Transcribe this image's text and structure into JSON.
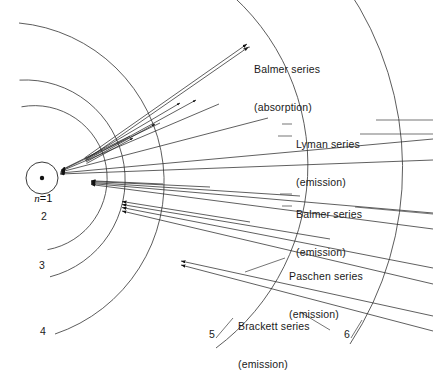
{
  "figure": {
    "type": "bohr-model-spectral-series-diagram",
    "background_color": "#ffffff",
    "line_color": "#2b2b2b",
    "center": {
      "x": 42,
      "y": 178
    }
  },
  "nucleus": {
    "label": "n = 1",
    "n_symbol": "n",
    "equals": "=",
    "value": "1"
  },
  "shells": [
    {
      "n": 1,
      "label": "n = 1",
      "radius": 22,
      "label_x": 22,
      "label_y": 183
    },
    {
      "n": 2,
      "label": "2",
      "radius": 72,
      "label_x": 41,
      "label_y": 216
    },
    {
      "n": 3,
      "label": "3",
      "radius": 100,
      "label_x": 39,
      "label_y": 265
    },
    {
      "n": 4,
      "label": "4",
      "radius": 160,
      "label_x": 40,
      "label_y": 330
    },
    {
      "n": 5,
      "label": "5",
      "radius": 228,
      "label_x": 210,
      "label_y": 332
    },
    {
      "n": 6,
      "label": "6",
      "radius": 320,
      "label_x": 344,
      "label_y": 332
    }
  ],
  "series": [
    {
      "id": "balmer-absorption",
      "name": "Balmer series",
      "mode": "(absorption)",
      "direction": "outward",
      "from_shell": 2,
      "label_x": 254,
      "label_y": 38
    },
    {
      "id": "lyman-emission",
      "name": "Lyman series",
      "mode": "(emission)",
      "direction": "inward",
      "to_shell": 1,
      "label_x": 295,
      "label_y": 113
    },
    {
      "id": "balmer-emission",
      "name": "Balmer series",
      "mode": "(emission)",
      "direction": "inward",
      "to_shell": 2,
      "label_x": 295,
      "label_y": 183
    },
    {
      "id": "paschen-emission",
      "name": "Paschen series",
      "mode": "(emission)",
      "direction": "inward",
      "to_shell": 3,
      "label_x": 288,
      "label_y": 244
    },
    {
      "id": "brackett-emission",
      "name": "Brackett series",
      "mode": "(emission)",
      "direction": "inward",
      "to_shell": 4,
      "label_x": 238,
      "label_y": 294
    }
  ]
}
